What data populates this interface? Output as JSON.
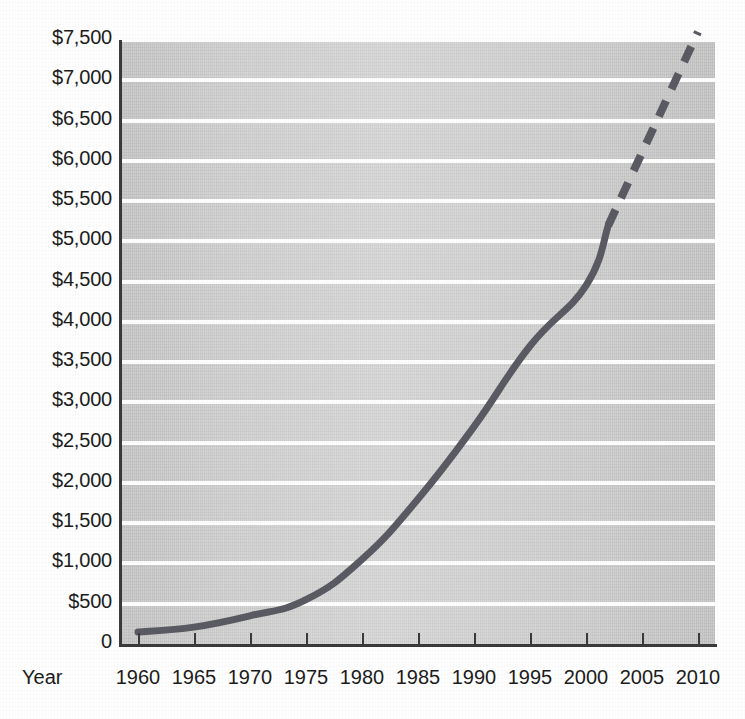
{
  "title": "",
  "axis": {
    "x_title": "Year",
    "y_title": ""
  },
  "ylabels": [
    "$7,500",
    "$7,000",
    "$6,500",
    "$6,000",
    "$5,500",
    "$5,000",
    "$4,500",
    "$4,000",
    "$3,500",
    "$3,000",
    "$2,500",
    "$2,000",
    "$1,500",
    "$1,000",
    "$500",
    "0"
  ],
  "xlabels": [
    "1960",
    "1965",
    "1970",
    "1975",
    "1980",
    "1985",
    "1990",
    "1995",
    "2000",
    "2005",
    "2010"
  ],
  "colors": {
    "line": "#5a5a63",
    "panel": "#cfcfcf",
    "gridline": "#fdfdfd",
    "axis": "#3a3a3a",
    "text": "#1c1c1c"
  },
  "chart_data": {
    "type": "line",
    "title": "",
    "xlabel": "Year",
    "ylabel": "",
    "xlim": [
      1960,
      2010
    ],
    "ylim": [
      0,
      7500
    ],
    "ytick_step": 500,
    "xtick_step": 5,
    "grid": true,
    "legend": "none",
    "series": [
      {
        "name": "Actual",
        "style": "solid",
        "color": "#5a5a63",
        "x": [
          1960,
          1965,
          1970,
          1975,
          1980,
          1985,
          1990,
          1995,
          2000,
          2002
        ],
        "values": [
          150,
          210,
          350,
          550,
          1050,
          1800,
          2700,
          3700,
          4450,
          5200
        ]
      },
      {
        "name": "Projected",
        "style": "dashed",
        "color": "#5a5a63",
        "x": [
          2002,
          2010
        ],
        "values": [
          5200,
          7600
        ]
      }
    ],
    "annotations": [
      {
        "text": "solid line = historical data through ~2002"
      },
      {
        "text": "dashed line = projection from ~2002 to 2010"
      }
    ]
  }
}
